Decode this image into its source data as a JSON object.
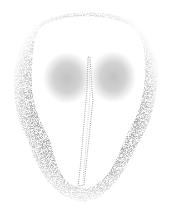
{
  "figure": {
    "type": "stippled-illustration",
    "colors": {
      "background": "#ffffff",
      "stipple": "#6b6b6b",
      "stipple_dark": "#4a4a4a",
      "body_fill": "#ffffff"
    },
    "elements": {
      "outer_halo": "stippled-halo",
      "body": "white-body-outline",
      "left_lobe": {
        "cx": 67,
        "cy": 78,
        "rx": 21,
        "ry": 23
      },
      "right_lobe": {
        "cx": 113,
        "cy": 77,
        "rx": 20,
        "ry": 23
      },
      "median_strip": {
        "top": [
          88,
          57
        ],
        "bottom": [
          78,
          186
        ]
      }
    }
  }
}
